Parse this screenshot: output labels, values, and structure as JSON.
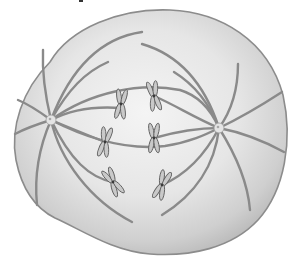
{
  "figure": {
    "colors": {
      "background": "#ffffff",
      "cell_fill_light": "#f2f2f2",
      "cell_fill_dark": "#c4c4c4",
      "cell_outline": "#8c8c8c",
      "fiber": "#8a8a8a",
      "chromosome_fill": "#c9c9c9",
      "chromosome_outline": "#5e5e5e"
    },
    "centrosomes": [
      {
        "name": "left-centrosome",
        "x": 51,
        "y": 120
      },
      {
        "name": "right-centrosome",
        "x": 219,
        "y": 128
      }
    ],
    "chromosomes": [
      {
        "name": "chromosome-1",
        "x": 121,
        "y": 104,
        "angle": 5
      },
      {
        "name": "chromosome-2",
        "x": 154,
        "y": 96,
        "angle": -10
      },
      {
        "name": "chromosome-3",
        "x": 105,
        "y": 142,
        "angle": 10
      },
      {
        "name": "chromosome-4",
        "x": 154,
        "y": 138,
        "angle": 0
      },
      {
        "name": "chromosome-5",
        "x": 113,
        "y": 182,
        "angle": -30
      },
      {
        "name": "chromosome-6",
        "x": 162,
        "y": 185,
        "angle": 20
      }
    ]
  }
}
